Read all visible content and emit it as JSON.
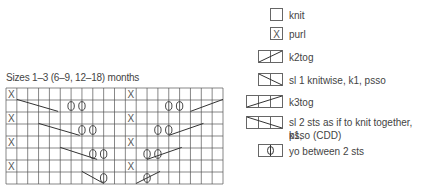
{
  "chart": {
    "title": "Sizes 1–3 (6–9, 12–18) months",
    "columns": 20,
    "rows": 8,
    "purl_marks": [
      [
        0,
        0
      ],
      [
        0,
        11
      ],
      [
        2,
        0
      ],
      [
        2,
        11
      ],
      [
        4,
        0
      ],
      [
        4,
        11
      ],
      [
        6,
        0
      ],
      [
        6,
        11
      ]
    ],
    "yo_marks": [
      [
        1,
        5.5
      ],
      [
        1,
        6.5
      ],
      [
        3,
        6.5
      ],
      [
        3,
        7.5
      ],
      [
        5,
        7.5
      ],
      [
        5,
        8.5
      ],
      [
        7,
        8.5
      ],
      [
        1,
        14.5
      ],
      [
        1,
        15.5
      ],
      [
        3,
        13.5
      ],
      [
        3,
        14.5
      ],
      [
        5,
        12.5
      ],
      [
        5,
        13.5
      ],
      [
        7,
        12.5
      ]
    ],
    "decrease_lines": [
      {
        "from": [
          0.95,
          1.0
        ],
        "to": [
          1.95,
          4.8
        ]
      },
      {
        "from": [
          2.95,
          3.0
        ],
        "to": [
          3.95,
          6.8
        ]
      },
      {
        "from": [
          4.95,
          5.0
        ],
        "to": [
          5.95,
          8.4
        ]
      },
      {
        "from": [
          6.95,
          7.0
        ],
        "to": [
          7.95,
          9.0
        ]
      },
      {
        "from": [
          1.95,
          17.0
        ],
        "to": [
          0.95,
          20.0
        ]
      },
      {
        "from": [
          3.95,
          15.0
        ],
        "to": [
          2.95,
          18.2
        ]
      },
      {
        "from": [
          5.95,
          13.0
        ],
        "to": [
          4.95,
          16.2
        ]
      },
      {
        "from": [
          7.95,
          12.0
        ],
        "to": [
          6.95,
          14.2
        ]
      }
    ]
  },
  "legend": {
    "items": [
      {
        "symbol": "knit",
        "label": "knit"
      },
      {
        "symbol": "purl",
        "label": "purl"
      },
      {
        "symbol": "k2tog",
        "label": "k2tog"
      },
      {
        "symbol": "skp",
        "label": "sl 1 knitwise, k1, psso"
      },
      {
        "symbol": "k3tog",
        "label": "k3tog"
      },
      {
        "symbol": "cdd",
        "label_line1": "sl 2 sts as if to knit together, k1,",
        "label_line2": "psso (CDD)"
      },
      {
        "symbol": "yo",
        "label": "yo between 2 sts"
      }
    ]
  },
  "colors": {
    "grid": "#555555",
    "text": "#444444",
    "background": "#ffffff"
  }
}
